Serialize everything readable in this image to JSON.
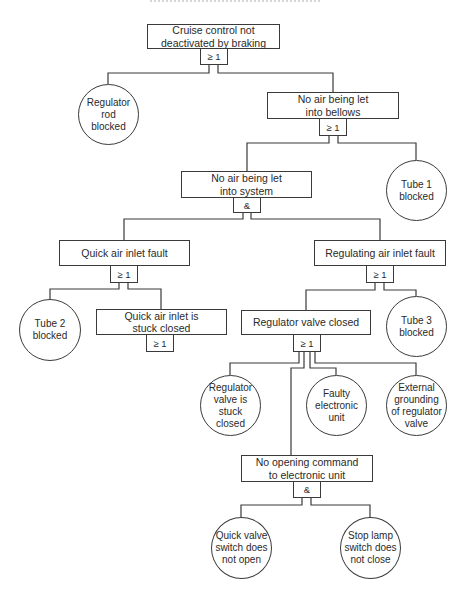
{
  "diagram": {
    "type": "fault-tree",
    "top_event": {
      "id": "E0",
      "label": "Cruise control not\ndeactivated by braking",
      "gate": "≥ 1"
    },
    "events": {
      "E1": {
        "label": "No air being let\ninto bellows",
        "gate": "≥ 1"
      },
      "E2": {
        "label": "No air being let\ninto system",
        "gate": "&"
      },
      "E3": {
        "label": "Quick air inlet fault",
        "gate": "≥ 1"
      },
      "E4": {
        "label": "Regulating air inlet fault",
        "gate": "≥ 1"
      },
      "E5": {
        "label": "Quick air inlet is\nstuck closed",
        "gate": "≥ 1"
      },
      "E6": {
        "label": "Regulator valve closed",
        "gate": "≥ 1"
      },
      "E7": {
        "label": "No opening command\nto electronic unit",
        "gate": "&"
      }
    },
    "basic_events": {
      "B1": {
        "label": "Regulator\nrod\nblocked"
      },
      "B2": {
        "label": "Tube 1\nblocked"
      },
      "B3": {
        "label": "Tube 2\nblocked"
      },
      "B4": {
        "label": "Tube 3\nblocked"
      },
      "B5": {
        "label": "Regulator\nvalve is\nstuck\nclosed"
      },
      "B6": {
        "label": "Faulty\nelectronic\nunit"
      },
      "B7": {
        "label": "External\ngrounding\nof regulator\nvalve"
      },
      "B8": {
        "label": "Quick valve\nswitch does\nnot open"
      },
      "B9": {
        "label": "Stop lamp\nswitch does\nnot close"
      }
    },
    "edges": [
      [
        "E0",
        "B1"
      ],
      [
        "E0",
        "E1"
      ],
      [
        "E1",
        "E2"
      ],
      [
        "E1",
        "B2"
      ],
      [
        "E2",
        "E3"
      ],
      [
        "E2",
        "E4"
      ],
      [
        "E3",
        "B3"
      ],
      [
        "E3",
        "E5"
      ],
      [
        "E4",
        "E6"
      ],
      [
        "E4",
        "B4"
      ],
      [
        "E6",
        "B5"
      ],
      [
        "E6",
        "E7"
      ],
      [
        "E6",
        "B6"
      ],
      [
        "E6",
        "B7"
      ],
      [
        "E7",
        "B8"
      ],
      [
        "E7",
        "B9"
      ]
    ],
    "gate_legend": {
      "or": "≥ 1",
      "and": "&"
    }
  }
}
